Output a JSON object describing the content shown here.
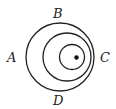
{
  "labels": {
    "A": "A",
    "B": "B",
    "C": "C",
    "D": "D"
  },
  "circles": [
    {
      "name": "outer",
      "cx": 60,
      "cy": 57,
      "r": 34
    },
    {
      "name": "middle",
      "cx": 67,
      "cy": 57,
      "r": 24
    },
    {
      "name": "inner",
      "cx": 72,
      "cy": 57,
      "r": 12.5
    }
  ],
  "point": {
    "cx": 76.5,
    "cy": 57.5,
    "r": 2.2
  },
  "colors": {
    "stroke": "#222222"
  }
}
